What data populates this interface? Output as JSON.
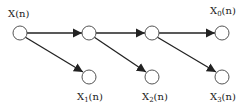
{
  "diagram": {
    "type": "signal-decomposition-tree",
    "colors": {
      "line": "#222222",
      "node_fill": "#ffffff",
      "node_stroke": "#555555"
    },
    "labels": {
      "input": {
        "base": "X",
        "sub": "",
        "arg": "(n)"
      },
      "x0": {
        "base": "X",
        "sub": "0",
        "arg": "(n)"
      },
      "x1": {
        "base": "X",
        "sub": "1",
        "arg": "(n)"
      },
      "x2": {
        "base": "X",
        "sub": "2",
        "arg": "(n)"
      },
      "x3": {
        "base": "X",
        "sub": "3",
        "arg": "(n)"
      }
    },
    "nodes": [
      {
        "id": "n0",
        "cx": 20,
        "cy": 33
      },
      {
        "id": "n1",
        "cx": 89,
        "cy": 33
      },
      {
        "id": "n2",
        "cx": 152,
        "cy": 33
      },
      {
        "id": "n3",
        "cx": 222,
        "cy": 33
      },
      {
        "id": "b1",
        "cx": 89,
        "cy": 77
      },
      {
        "id": "b2",
        "cx": 152,
        "cy": 77
      },
      {
        "id": "b3",
        "cx": 222,
        "cy": 77
      }
    ],
    "edges": [
      {
        "from": "n0",
        "to": "n1"
      },
      {
        "from": "n1",
        "to": "n2"
      },
      {
        "from": "n2",
        "to": "n3"
      },
      {
        "from": "n0",
        "to": "b1"
      },
      {
        "from": "n1",
        "to": "b2"
      },
      {
        "from": "n2",
        "to": "b3"
      }
    ]
  }
}
